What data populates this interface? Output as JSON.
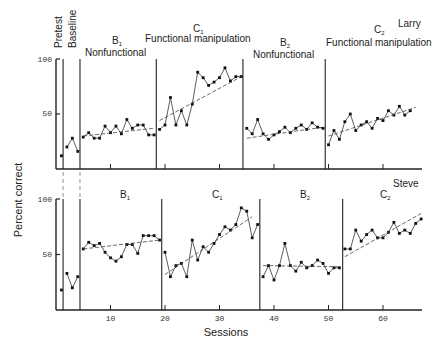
{
  "chart_data": {
    "type": "line",
    "title": "",
    "xlabel": "Sessions",
    "ylabel": "Percent correct",
    "xticks": [
      10,
      20,
      30,
      40,
      50,
      60
    ],
    "yticks": [
      50,
      100
    ],
    "ylim": [
      0,
      100
    ],
    "xlim": [
      0,
      67
    ],
    "top_phase_labels": {
      "pretest": "Pretest",
      "baseline": "Baseline",
      "b1": "B",
      "b1_sub": "1",
      "b1_desc": "Nonfunctional",
      "c1": "C",
      "c1_sub": "1",
      "c1_desc": "Functional manipulation",
      "b2": "B",
      "b2_sub": "2",
      "b2_desc": "Nonfunctional",
      "c2": "C",
      "c2_sub": "2",
      "c2_desc": "Functional manipulation"
    },
    "panels": [
      {
        "subject": "Larry",
        "phase_boundaries": [
          1.3,
          4.4,
          18.4,
          34.3,
          49.4
        ],
        "phases": [
          {
            "name": "Pretest",
            "sessions": [
              1
            ],
            "values": [
              12
            ]
          },
          {
            "name": "Baseline",
            "sessions": [
              2,
              3,
              4
            ],
            "values": [
              20,
              28,
              16
            ]
          },
          {
            "name": "B1",
            "sessions": [
              5,
              6,
              7,
              8,
              9,
              10,
              11,
              12,
              13,
              14,
              15,
              16,
              17,
              18
            ],
            "values": [
              29,
              33,
              28,
              28,
              39,
              33,
              39,
              32,
              45,
              37,
              40,
              40,
              31,
              31
            ],
            "trend": [
              [
                5,
                30
              ],
              [
                18,
                37
              ]
            ]
          },
          {
            "name": "C1",
            "sessions": [
              19,
              20,
              21,
              22,
              23,
              24,
              25,
              26,
              27,
              28,
              29,
              30,
              31,
              32,
              33,
              34
            ],
            "values": [
              36,
              40,
              65,
              40,
              53,
              40,
              59,
              88,
              83,
              76,
              79,
              83,
              92,
              80,
              84,
              84
            ],
            "trend": [
              [
                19,
                44
              ],
              [
                34,
                84
              ]
            ]
          },
          {
            "name": "B2",
            "sessions": [
              35,
              36,
              37,
              38,
              39,
              40,
              41,
              42,
              43,
              44,
              45,
              46,
              47,
              48,
              49
            ],
            "values": [
              37,
              32,
              45,
              32,
              27,
              31,
              34,
              38,
              33,
              37,
              40,
              36,
              42,
              38,
              37
            ],
            "trend": [
              [
                35,
                28
              ],
              [
                49,
                38
              ]
            ]
          },
          {
            "name": "C2",
            "sessions": [
              50,
              51,
              52,
              53,
              54,
              55,
              56,
              57,
              58,
              59,
              60,
              61,
              62,
              63,
              64,
              65
            ],
            "values": [
              22,
              35,
              27,
              43,
              50,
              35,
              40,
              43,
              37,
              46,
              44,
              53,
              49,
              57,
              49,
              53
            ],
            "trend": [
              [
                50,
                30
              ],
              [
                66,
                56
              ]
            ]
          }
        ]
      },
      {
        "subject": "Steve",
        "phase_boundaries": [
          1.3,
          4.4,
          19.4,
          37.4,
          52.6
        ],
        "phases": [
          {
            "name": "Pretest",
            "sessions": [
              1
            ],
            "values": [
              18
            ]
          },
          {
            "name": "Baseline",
            "sessions": [
              2,
              3,
              4
            ],
            "values": [
              33,
              20,
              30
            ]
          },
          {
            "name": "B1",
            "sessions": [
              5,
              6,
              7,
              8,
              9,
              10,
              11,
              12,
              13,
              14,
              15,
              16,
              17,
              18,
              19
            ],
            "values": [
              55,
              61,
              58,
              60,
              52,
              47,
              44,
              48,
              59,
              59,
              51,
              67,
              67,
              67,
              63
            ],
            "trend": [
              [
                5,
                55
              ],
              [
                19,
                63
              ]
            ]
          },
          {
            "name": "C1",
            "sessions": [
              20,
              21,
              22,
              23,
              24,
              25,
              26,
              27,
              28,
              29,
              30,
              31,
              32,
              33,
              34,
              35,
              36,
              37
            ],
            "values": [
              52,
              30,
              40,
              42,
              30,
              63,
              45,
              57,
              52,
              60,
              68,
              75,
              72,
              77,
              92,
              89,
              65,
              77
            ],
            "trend": [
              [
                20,
                32
              ],
              [
                36,
                84
              ]
            ]
          },
          {
            "name": "B2",
            "sessions": [
              38,
              39,
              40,
              41,
              42,
              43,
              44,
              45,
              46,
              47,
              48,
              49,
              50,
              51,
              52
            ],
            "values": [
              30,
              40,
              27,
              40,
              60,
              40,
              35,
              43,
              38,
              40,
              45,
              42,
              33,
              38,
              38
            ],
            "trend": [
              [
                38,
                40
              ],
              [
                52,
                39
              ]
            ]
          },
          {
            "name": "C2",
            "sessions": [
              53,
              54,
              55,
              56,
              57,
              58,
              59,
              60,
              61,
              62,
              63,
              64,
              65,
              66,
              67
            ],
            "values": [
              55,
              55,
              72,
              62,
              68,
              72,
              65,
              65,
              70,
              79,
              69,
              72,
              69,
              78,
              82
            ],
            "trend": [
              [
                53,
                48
              ],
              [
                67,
                87
              ]
            ]
          }
        ]
      }
    ]
  },
  "labels": {
    "ylabel": "Percent correct",
    "xlabel": "Sessions",
    "subject_top": "Larry",
    "subject_bottom": "Steve",
    "bottom_b1": "B",
    "bottom_b1_sub": "1",
    "bottom_c1": "C",
    "bottom_c1_sub": "1",
    "bottom_b2": "B",
    "bottom_b2_sub": "2",
    "bottom_c2": "C",
    "bottom_c2_sub": "2",
    "ytick_100": "100",
    "ytick_50": "50"
  }
}
